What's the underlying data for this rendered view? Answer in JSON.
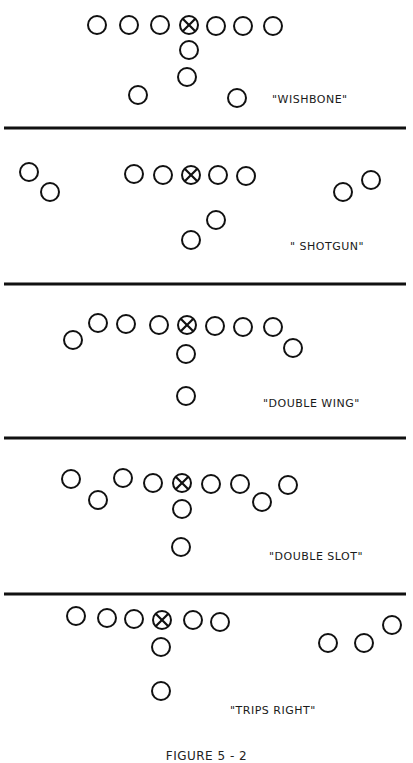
{
  "colors": {
    "ink": "#111111",
    "background": "#ffffff"
  },
  "player_radius": 9,
  "formations": [
    {
      "name": "WISHBONE",
      "label": "\"WISHBONE\"",
      "label_pos": [
        272,
        93
      ],
      "center": [
        189,
        25
      ],
      "players": [
        [
          97,
          25
        ],
        [
          129,
          25
        ],
        [
          160,
          25
        ],
        [
          216,
          26
        ],
        [
          243,
          26
        ],
        [
          273,
          26
        ],
        [
          189,
          50
        ],
        [
          187,
          77
        ],
        [
          138,
          95
        ],
        [
          237,
          98
        ]
      ]
    },
    {
      "name": "SHOTGUN",
      "label": "\" SHOTGUN\"",
      "label_pos": [
        290,
        240
      ],
      "center": [
        191,
        175
      ],
      "players": [
        [
          29,
          172
        ],
        [
          50,
          192
        ],
        [
          134,
          174
        ],
        [
          163,
          175
        ],
        [
          218,
          175
        ],
        [
          246,
          176
        ],
        [
          343,
          192
        ],
        [
          371,
          180
        ],
        [
          216,
          220
        ],
        [
          191,
          240
        ]
      ]
    },
    {
      "name": "DOUBLE WING",
      "label": "\"DOUBLE WING\"",
      "label_pos": [
        263,
        397
      ],
      "center": [
        187,
        325
      ],
      "players": [
        [
          73,
          340
        ],
        [
          98,
          323
        ],
        [
          126,
          324
        ],
        [
          159,
          325
        ],
        [
          215,
          326
        ],
        [
          243,
          327
        ],
        [
          273,
          327
        ],
        [
          293,
          348
        ],
        [
          186,
          354
        ],
        [
          186,
          396
        ]
      ]
    },
    {
      "name": "DOUBLE SLOT",
      "label": "\"DOUBLE SLOT\"",
      "label_pos": [
        269,
        550
      ],
      "center": [
        182,
        483
      ],
      "players": [
        [
          71,
          479
        ],
        [
          98,
          500
        ],
        [
          123,
          478
        ],
        [
          153,
          483
        ],
        [
          211,
          484
        ],
        [
          240,
          484
        ],
        [
          262,
          502
        ],
        [
          288,
          485
        ],
        [
          182,
          509
        ],
        [
          181,
          547
        ]
      ]
    },
    {
      "name": "TRIPS RIGHT",
      "label": "\"TRIPS RIGHT\"",
      "label_pos": [
        230,
        704
      ],
      "center": [
        162,
        620
      ],
      "players": [
        [
          76,
          616
        ],
        [
          107,
          618
        ],
        [
          134,
          619
        ],
        [
          193,
          620
        ],
        [
          220,
          622
        ],
        [
          161,
          647
        ],
        [
          161,
          691
        ],
        [
          328,
          643
        ],
        [
          364,
          643
        ],
        [
          392,
          625
        ]
      ]
    }
  ],
  "dividers": [
    128,
    284,
    438,
    594
  ],
  "caption": "FIGURE 5 - 2",
  "caption_top": 749
}
